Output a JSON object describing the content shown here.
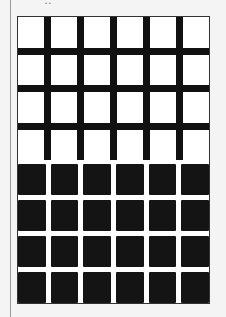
{
  "figure": {
    "type": "hermann-grid-illusion",
    "top_panel": {
      "rows": 4,
      "cols": 6,
      "square_color": "#ffffff",
      "line_color": "#111111"
    },
    "bottom_panel": {
      "rows": 4,
      "cols": 6,
      "square_color": "#141414",
      "line_color": "#ffffff"
    }
  }
}
